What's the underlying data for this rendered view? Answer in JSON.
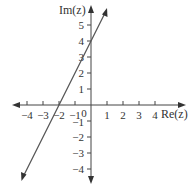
{
  "diagram": {
    "type": "complex-plane-line",
    "axes": {
      "x_label": "Re(z)",
      "y_label": "Im(z)",
      "x_ticks": [
        -4,
        -3,
        -2,
        -1,
        1,
        2,
        3,
        4
      ],
      "y_ticks": [
        5,
        4,
        3,
        2,
        1,
        -1,
        -2,
        -3,
        -4
      ],
      "origin_label": "0",
      "x_range": [
        -4.9,
        5.8
      ],
      "y_range": [
        -4.7,
        6.1
      ]
    },
    "line": {
      "description": "Straight line Im(z) = 2 Re(z) + 4",
      "passes_through": [
        [
          -2,
          0
        ],
        [
          0,
          4
        ]
      ],
      "slope": 2,
      "intercept": 4,
      "color": "#555555"
    },
    "colors": {
      "axis": "#444444",
      "text": "#333333",
      "background": "#ffffff"
    }
  },
  "labels": {
    "re": "Re(z)",
    "im": "Im(z)",
    "zero": "0",
    "x": {
      "m4": "−4",
      "m3": "−3",
      "m2": "−2",
      "m1": "−1",
      "p1": "1",
      "p2": "2",
      "p3": "3",
      "p4": "4"
    },
    "y": {
      "p5": "5",
      "p4": "4",
      "p3": "3",
      "p2": "2",
      "p1": "1",
      "m1": "−1",
      "m2": "−2",
      "m3": "−3",
      "m4": "−4"
    }
  }
}
